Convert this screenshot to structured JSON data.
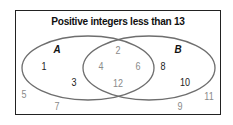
{
  "title": "Positive integers less than 13",
  "sets": {
    "A": {
      "label": "A"
    },
    "B": {
      "label": "B"
    }
  },
  "colors": {
    "outline": "#6e6e6e",
    "frame": "#222222",
    "exclusive_text": "#222222",
    "shared_text": "#8a8a8a"
  },
  "regions": {
    "a_only": [
      "1",
      "3"
    ],
    "intersection": [
      "2",
      "4",
      "6",
      "12"
    ],
    "b_only": [
      "8",
      "10"
    ],
    "outside": [
      "5",
      "7",
      "9",
      "11"
    ]
  }
}
